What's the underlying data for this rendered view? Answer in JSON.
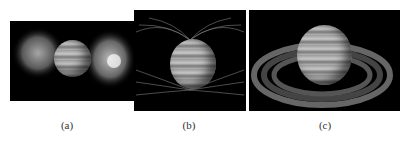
{
  "figure": {
    "panels": [
      {
        "id": "a",
        "caption": "(a)",
        "description": "Jupiter with bright lobes of emission on both sides"
      },
      {
        "id": "b",
        "caption": "(b)",
        "description": "Jupiter with magnetic field lines"
      },
      {
        "id": "c",
        "caption": "(c)",
        "description": "Jupiter with ring-shaped torus"
      }
    ]
  }
}
